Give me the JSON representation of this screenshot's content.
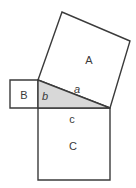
{
  "figure": {
    "canvas": {
      "width": 136,
      "height": 188
    },
    "colors": {
      "background": "#ffffff",
      "stroke": "#3b3b3b",
      "triangle_fill": "#d8d8d8",
      "square_fill": "#ffffff",
      "label_text": "#3a3a3a"
    },
    "labels": {
      "square_a_label": "A",
      "square_b_label": "B",
      "square_c_label": "C",
      "side_a_label": "a",
      "side_b_label": "b",
      "side_c_label": "c"
    },
    "shapes": {
      "triangle": {
        "name": "right-triangle",
        "points": "38,80 110,108 38,108",
        "fill": "#d8d8d8"
      },
      "square_a": {
        "name": "square-on-side-a",
        "points": "38,80 62,12 130,41 110,108",
        "fill": "#ffffff"
      },
      "square_b": {
        "name": "square-on-side-b",
        "points": "10,80 38,80 38,108 10,108",
        "fill": "#ffffff"
      },
      "square_c": {
        "name": "square-on-side-c",
        "points": "38,108 110,108 110,180 38,180",
        "fill": "#ffffff"
      }
    },
    "label_positions": {
      "A": {
        "x": 89,
        "y": 60
      },
      "B": {
        "x": 24,
        "y": 95
      },
      "C": {
        "x": 73,
        "y": 146
      },
      "a": {
        "x": 77,
        "y": 89
      },
      "b": {
        "x": 45,
        "y": 96
      },
      "c": {
        "x": 72,
        "y": 119
      }
    }
  }
}
